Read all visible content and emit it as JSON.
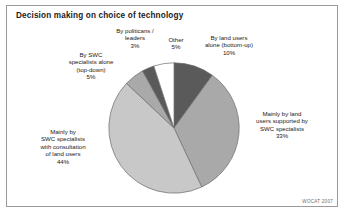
{
  "figure": {
    "title": "Decision making on choice of technology",
    "credit": "WOCAT 2007"
  },
  "labels": {
    "politicians": "By politicans /\nleaders\n3%",
    "other": "Other\n5%",
    "land_users_alone": "By land users\nalone (bottom-up)\n10%",
    "swc_alone": "By SWC\nspecialists alone\n(top-down)\n5%",
    "supported": "Mainly by land\nusers supported by\nSWC specialists\n33%",
    "consultation": "Mainly by\nSWC specialists\nwith consultation\nof land users\n44%"
  },
  "chart_data": {
    "type": "pie",
    "title": "Decision making on choice of technology",
    "xlabel": "",
    "ylabel": "",
    "unit": "%",
    "start_angle_deg": 0,
    "direction": "clockwise",
    "legend": "none",
    "labels_placement": "outside-callout",
    "categories": [
      "By land users alone (bottom-up)",
      "Mainly by land users supported by SWC specialists",
      "Mainly by SWC specialists with consultation of land users",
      "By SWC specialists alone (top-down)",
      "By politicans / leaders",
      "Other"
    ],
    "values": [
      10,
      33,
      44,
      5,
      3,
      5
    ],
    "value_labels": [
      "10%",
      "33%",
      "44%",
      "5%",
      "3%",
      "5%"
    ],
    "colors": [
      "#5a5a5a",
      "#a9a9a9",
      "#c8c8c8",
      "#a9a9a9",
      "#5a5a5a",
      "#ffffff"
    ],
    "slice_stroke": "#6e6e6e",
    "total": 100
  },
  "style": {
    "background": "#ffffff",
    "frame_border": "#9a9a9a",
    "text_color": "#1a1a1a",
    "credit_color": "#6d6d6d"
  }
}
